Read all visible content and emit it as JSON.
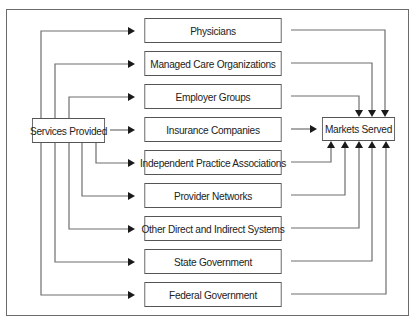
{
  "diagram": {
    "source": {
      "label": "Services Provided"
    },
    "target": {
      "label": "Markets Served"
    },
    "channels": [
      {
        "label": "Physicians"
      },
      {
        "label": "Managed Care Organizations"
      },
      {
        "label": "Employer Groups"
      },
      {
        "label": "Insurance Companies"
      },
      {
        "label": "Independent Practice Associations"
      },
      {
        "label": "Provider Networks"
      },
      {
        "label": "Other Direct and Indirect Systems"
      },
      {
        "label": "State Government"
      },
      {
        "label": "Federal Government"
      }
    ],
    "colors": {
      "line": "#6e6e6e",
      "arrow": "#1a1a1a",
      "box_border": "#555555",
      "text": "#222222"
    }
  }
}
